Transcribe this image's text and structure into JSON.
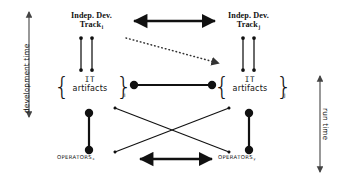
{
  "diagram": {
    "axes": {
      "left": {
        "label": "development time",
        "name": "development-time-axis"
      },
      "right": {
        "label": "run time",
        "name": "run-time-axis"
      }
    },
    "nodes": {
      "track_i": {
        "line1": "Indep. Dev.",
        "line2": "Track",
        "subscript": "i"
      },
      "track_j": {
        "line1": "Indep. Dev.",
        "line2": "Track",
        "subscript": "j"
      },
      "artifacts_i": {
        "line1": "IT",
        "line2": "artifacts",
        "subscript": "i",
        "brace_open": "{",
        "brace_close": "}"
      },
      "artifacts_j": {
        "line1": "IT",
        "line2": "artifacts",
        "subscript": "j",
        "brace_open": "{",
        "brace_close": "}"
      },
      "operators_x": {
        "label": "OPERATORS",
        "subscript": "x"
      },
      "operators_y": {
        "label": "OPERATORS",
        "subscript": "y"
      }
    },
    "connectors": [
      {
        "name": "track-i-to-track-j",
        "style": "solid-thick",
        "heads": "both"
      },
      {
        "name": "track-i-to-artifacts-i-left",
        "style": "solid-thin",
        "heads": "both"
      },
      {
        "name": "track-i-to-artifacts-i-right",
        "style": "solid-thin",
        "heads": "both"
      },
      {
        "name": "track-j-to-artifacts-j-left",
        "style": "solid-thin",
        "heads": "both"
      },
      {
        "name": "track-j-to-artifacts-j-right",
        "style": "solid-thin",
        "heads": "both"
      },
      {
        "name": "track-i-to-artifacts-j-dotted",
        "style": "dotted",
        "heads": "end"
      },
      {
        "name": "artifacts-i-to-artifacts-j",
        "style": "solid-thick",
        "heads": "both"
      },
      {
        "name": "artifacts-i-to-operators-x",
        "style": "solid-thick",
        "heads": "both"
      },
      {
        "name": "artifacts-j-to-operators-y",
        "style": "solid-thick",
        "heads": "both"
      },
      {
        "name": "artifacts-i-to-operators-y",
        "style": "solid-thin",
        "heads": "both"
      },
      {
        "name": "artifacts-j-to-operators-x",
        "style": "solid-thin",
        "heads": "both"
      },
      {
        "name": "operators-x-to-operators-y",
        "style": "solid-thick",
        "heads": "both"
      }
    ],
    "colors": {
      "ink": "#111111",
      "background": "#ffffff"
    }
  }
}
